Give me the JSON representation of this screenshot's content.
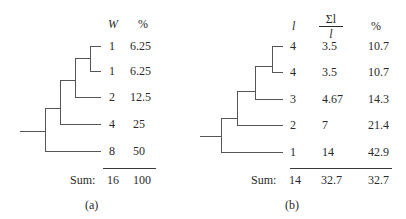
{
  "panel_a": {
    "caption": "(a)",
    "headers": {
      "w": "W",
      "pct": "%"
    },
    "rows": [
      {
        "w": "1",
        "pct": "6.25"
      },
      {
        "w": "1",
        "pct": "6.25"
      },
      {
        "w": "2",
        "pct": "12.5"
      },
      {
        "w": "4",
        "pct": "25"
      },
      {
        "w": "8",
        "pct": "50"
      }
    ],
    "sum": {
      "label": "Sum:",
      "w": "16",
      "pct": "100"
    }
  },
  "panel_b": {
    "caption": "(b)",
    "headers": {
      "l": "l",
      "ratio_num": "Σl",
      "ratio_den": "l",
      "pct": "%"
    },
    "rows": [
      {
        "l": "4",
        "ratio": "3.5",
        "pct": "10.7"
      },
      {
        "l": "4",
        "ratio": "3.5",
        "pct": "10.7"
      },
      {
        "l": "3",
        "ratio": "4.67",
        "pct": "14.3"
      },
      {
        "l": "2",
        "ratio": "7",
        "pct": "21.4"
      },
      {
        "l": "1",
        "ratio": "14",
        "pct": "42.9"
      }
    ],
    "sum": {
      "label": "Sum:",
      "l": "14",
      "ratio": "32.7",
      "pct": "32.7"
    }
  },
  "colors": {
    "line": "#555555",
    "text": "#2a2a2a"
  }
}
